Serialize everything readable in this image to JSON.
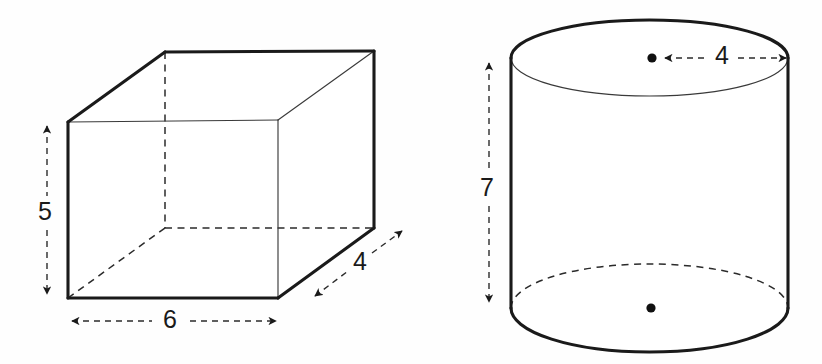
{
  "figure": {
    "background_color": "#fefefe",
    "stroke_color": "#1a1a1a",
    "hidden_edge_color": "#2b2b2b"
  },
  "shapes": [
    {
      "name": "rectangular-prism",
      "type": "box",
      "dimensions": [
        {
          "key": "height",
          "label": "5",
          "orientation": "vertical",
          "position": "left"
        },
        {
          "key": "width",
          "label": "6",
          "orientation": "horizontal",
          "position": "bottom"
        },
        {
          "key": "depth",
          "label": "4",
          "orientation": "diagonal",
          "position": "bottom-right"
        }
      ]
    },
    {
      "name": "cylinder",
      "type": "cylinder",
      "dimensions": [
        {
          "key": "height",
          "label": "7",
          "orientation": "vertical",
          "position": "left"
        },
        {
          "key": "radius",
          "label": "4",
          "orientation": "horizontal",
          "position": "top"
        }
      ]
    }
  ],
  "labels": {
    "box_height": "5",
    "box_width": "6",
    "box_depth": "4",
    "cylinder_height": "7",
    "cylinder_radius": "4"
  }
}
